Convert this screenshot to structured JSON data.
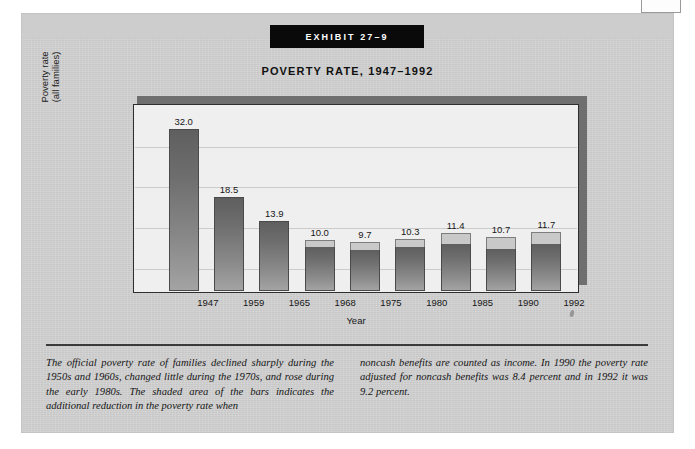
{
  "banner": {
    "label": "EXHIBIT 27–9"
  },
  "title": "POVERTY RATE, 1947–1992",
  "axes": {
    "y_label_line1": "Poverty rate",
    "y_label_line2": "(all families)",
    "x_label": "Year"
  },
  "caption": {
    "left": "The official poverty rate of families declined sharply during the 1950s and 1960s, changed little during the 1970s, and rose during the early 1980s. The shaded area of the bars indicates the additional reduction in the poverty rate when",
    "right": "noncash benefits are counted as income. In 1990 the poverty rate adjusted for noncash benefits was 8.4 percent and in 1992 it was 9.2 percent."
  },
  "colors": {
    "page_background": "#ffffff",
    "panel": "#d2d2d2",
    "banner": "#0a0a0a",
    "banner_text": "#ffffff",
    "plot_background": "#efefef",
    "bar_body": "#6d6d6d",
    "bar_shaded_cap": "#c9c9c9",
    "frame": "#2e2e2e",
    "shadow": "#6f6f6f"
  },
  "chart_data": {
    "type": "bar",
    "title": "POVERTY RATE, 1947–1992",
    "xlabel": "Year",
    "ylabel": "Poverty rate (all families)",
    "ylim": [
      0,
      35
    ],
    "grid": true,
    "legend": null,
    "categories": [
      "1947",
      "1959",
      "1965",
      "1968",
      "1975",
      "1980",
      "1985",
      "1990",
      "1992"
    ],
    "values": [
      32.0,
      18.5,
      13.9,
      10.0,
      9.7,
      10.3,
      11.4,
      10.7,
      11.7
    ],
    "labels": [
      "32.0",
      "18.5",
      "13.9",
      "10.0",
      "9.7",
      "10.3",
      "11.4",
      "10.7",
      "11.7"
    ],
    "series": [
      {
        "name": "Official poverty rate",
        "values": [
          32.0,
          18.5,
          13.9,
          10.0,
          9.7,
          10.3,
          11.4,
          10.7,
          11.7
        ]
      },
      {
        "name": "Rate adjusted for noncash benefits (shaded reduction shown as bar cap)",
        "values": [
          null,
          null,
          null,
          8.6,
          8.0,
          8.6,
          9.2,
          8.4,
          9.2
        ]
      }
    ],
    "annotations": [
      "Shaded area of the bars indicates the additional reduction in the poverty rate when noncash benefits are counted as income.",
      "In 1990 the poverty rate adjusted for noncash benefits was 8.4 percent.",
      "In 1992 it was 9.2 percent."
    ]
  },
  "bars": [
    {
      "year": "1947",
      "value": "32.0",
      "body_pct": 91.4,
      "cap_pct": 0.0
    },
    {
      "year": "1959",
      "value": "18.5",
      "body_pct": 52.9,
      "cap_pct": 0.0
    },
    {
      "year": "1965",
      "value": "13.9",
      "body_pct": 39.7,
      "cap_pct": 0.0
    },
    {
      "year": "1968",
      "value": "10.0",
      "body_pct": 24.6,
      "cap_pct": 4.0
    },
    {
      "year": "1975",
      "value": "9.7",
      "body_pct": 22.9,
      "cap_pct": 4.8
    },
    {
      "year": "1980",
      "value": "10.3",
      "body_pct": 24.6,
      "cap_pct": 4.8
    },
    {
      "year": "1985",
      "value": "11.4",
      "body_pct": 26.3,
      "cap_pct": 6.3
    },
    {
      "year": "1990",
      "value": "10.7",
      "body_pct": 24.0,
      "cap_pct": 6.6
    },
    {
      "year": "1992",
      "value": "11.7",
      "body_pct": 26.3,
      "cap_pct": 7.2
    }
  ],
  "gridlines_pct": [
    22,
    44,
    66,
    88
  ]
}
